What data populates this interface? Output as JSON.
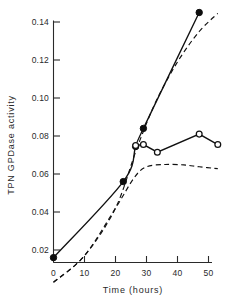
{
  "chart_data": {
    "type": "line",
    "title": "",
    "xlabel": "Time  (hours)",
    "ylabel": "TPN  GPDase  activity",
    "xlim": [
      0,
      55
    ],
    "ylim": [
      0.0,
      0.15
    ],
    "grid": false,
    "legend": "none",
    "xticks": [
      0,
      10,
      20,
      30,
      40,
      50
    ],
    "xtick_labels": [
      "0",
      "10",
      "20",
      "30",
      "40",
      "50"
    ],
    "yticks": [
      0.02,
      0.04,
      0.06,
      0.08,
      0.1,
      0.12,
      0.14
    ],
    "ytick_labels": [
      "0.02",
      "0.04",
      "0.06",
      "0.08",
      "0.10",
      "0.12",
      "0.14"
    ],
    "series": [
      {
        "name": "filled-circle-solid",
        "marker": "filled-circle",
        "linestyle": "solid",
        "x": [
          0,
          22.5,
          26.5,
          29,
          47
        ],
        "y": [
          0.016,
          0.056,
          0.0745,
          0.084,
          0.145
        ]
      },
      {
        "name": "open-circle-solid",
        "marker": "open-circle",
        "linestyle": "solid",
        "x": [
          26.5,
          29,
          33.5,
          47,
          53
        ],
        "y": [
          0.075,
          0.0755,
          0.0715,
          0.081,
          0.0755
        ]
      },
      {
        "name": "upper-dashed",
        "marker": "none",
        "linestyle": "dashed",
        "x": [
          0,
          10,
          20,
          27,
          33,
          40,
          47,
          53
        ],
        "y": [
          0.003,
          0.017,
          0.042,
          0.074,
          0.098,
          0.119,
          0.135,
          0.1445
        ]
      },
      {
        "name": "lower-dashed",
        "marker": "none",
        "linestyle": "dashed",
        "x": [
          0,
          10,
          20,
          26,
          30,
          36,
          42,
          47,
          53
        ],
        "y": [
          0.003,
          0.017,
          0.042,
          0.058,
          0.0638,
          0.065,
          0.0648,
          0.0638,
          0.0628
        ]
      }
    ]
  },
  "axes": {
    "y_title": "TPN  GPDase  activity",
    "x_title": "Time  (hours)",
    "x_tick_0": "0",
    "x_tick_1": "10",
    "x_tick_2": "20",
    "x_tick_3": "30",
    "x_tick_4": "40",
    "x_tick_5": "50",
    "y_tick_0": "0.02",
    "y_tick_1": "0.04",
    "y_tick_2": "0.06",
    "y_tick_3": "0.08",
    "y_tick_4": "0.10",
    "y_tick_5": "0.12",
    "y_tick_6": "0.14"
  },
  "colors": {
    "ink": "#111111",
    "background": "#ffffff"
  }
}
